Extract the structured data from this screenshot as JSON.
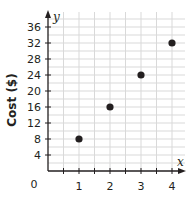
{
  "chart_data": {
    "type": "scatter",
    "title": "",
    "xlabel": "x",
    "ylabel": "Cost ($)",
    "y_variable": "y",
    "origin_label": "0",
    "x": [
      1,
      2,
      3,
      4
    ],
    "y": [
      8,
      16,
      24,
      32
    ],
    "points": [
      {
        "x": 1,
        "y": 8
      },
      {
        "x": 2,
        "y": 16
      },
      {
        "x": 3,
        "y": 24
      },
      {
        "x": 4,
        "y": 32
      }
    ],
    "xticks": [
      1,
      2,
      3,
      4
    ],
    "yticks": [
      4,
      8,
      12,
      16,
      20,
      24,
      28,
      32,
      36
    ],
    "xlim": [
      0,
      4.4
    ],
    "ylim": [
      0,
      39
    ],
    "grid": true,
    "minor_grid_x_step": 0.5,
    "minor_grid_y_step": 2,
    "legend": null
  },
  "colors": {
    "axis": "#231f20",
    "grid": "#d9d9d9",
    "point": "#231f20",
    "text": "#231f20"
  }
}
